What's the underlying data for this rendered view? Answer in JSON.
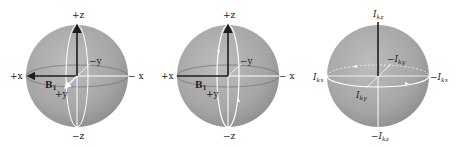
{
  "figure": {
    "panels": [
      {
        "id": "sphere-1",
        "labels": {
          "top": "+z",
          "bottom": "−z",
          "left": "+x",
          "right": "− x",
          "back": "−y",
          "front": "+y",
          "field": "B",
          "field_sub": "1"
        }
      },
      {
        "id": "sphere-2",
        "labels": {
          "top": "+z",
          "bottom": "−z",
          "left": "+x",
          "right": "− x",
          "back": "−y",
          "front": "+y",
          "field": "B",
          "field_sub": "1"
        }
      },
      {
        "id": "sphere-3",
        "labels": {
          "top": "I",
          "top_sub": "kz",
          "bottom": "−I",
          "bottom_sub": "kz",
          "left": "I",
          "left_sub": "kx",
          "right": "−I",
          "right_sub": "kx",
          "back": "−I",
          "back_sub": "ky",
          "front": "I",
          "front_sub": "ky"
        }
      }
    ],
    "colors": {
      "sphere": "#a9a9a9",
      "sphere_edge": "#8c8c8c",
      "axis_dark": "#1e1e1e",
      "highlight": "#ffffff"
    }
  }
}
